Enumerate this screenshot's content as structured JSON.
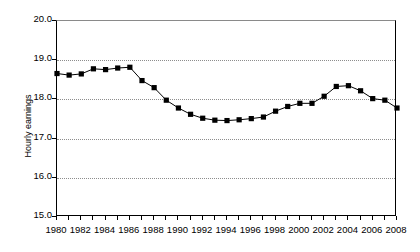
{
  "chart_data": {
    "type": "line",
    "title": "",
    "xlabel": "",
    "ylabel": "Hourly earnings",
    "ylim": [
      15.0,
      20.0
    ],
    "xlim": [
      1980,
      2008
    ],
    "grid": true,
    "legend": "none",
    "marker": "filled-square",
    "y_ticks": [
      "15.0",
      "16.0",
      "17.0",
      "18.0",
      "19.0",
      "20.0"
    ],
    "y_tick_values": [
      15.0,
      16.0,
      17.0,
      18.0,
      19.0,
      20.0
    ],
    "x_tick_labels": [
      "1980",
      "1982",
      "1984",
      "1986",
      "1988",
      "1990",
      "1992",
      "1994",
      "1996",
      "1998",
      "2000",
      "2002",
      "2004",
      "2006",
      "2008"
    ],
    "x_tick_values": [
      1980,
      1982,
      1984,
      1986,
      1988,
      1990,
      1992,
      1994,
      1996,
      1998,
      2000,
      2002,
      2004,
      2006,
      2008
    ],
    "x_minor_ticks": [
      1980,
      1981,
      1982,
      1983,
      1984,
      1985,
      1986,
      1987,
      1988,
      1989,
      1990,
      1991,
      1992,
      1993,
      1994,
      1995,
      1996,
      1997,
      1998,
      1999,
      2000,
      2001,
      2002,
      2003,
      2004,
      2005,
      2006,
      2007,
      2008
    ],
    "x": [
      1980,
      1981,
      1982,
      1983,
      1984,
      1985,
      1986,
      1987,
      1988,
      1989,
      1990,
      1991,
      1992,
      1993,
      1994,
      1995,
      1996,
      1997,
      1998,
      1999,
      2000,
      2001,
      2002,
      2003,
      2004,
      2005,
      2006,
      2007,
      2008
    ],
    "values": [
      18.66,
      18.62,
      18.65,
      18.78,
      18.76,
      18.8,
      18.82,
      18.48,
      18.3,
      17.98,
      17.78,
      17.62,
      17.52,
      17.47,
      17.46,
      17.48,
      17.51,
      17.55,
      17.7,
      17.82,
      17.9,
      17.9,
      18.08,
      18.33,
      18.35,
      18.22,
      18.02,
      17.98,
      17.78
    ],
    "series_name": "Hourly earnings",
    "series_color": "#000000"
  }
}
